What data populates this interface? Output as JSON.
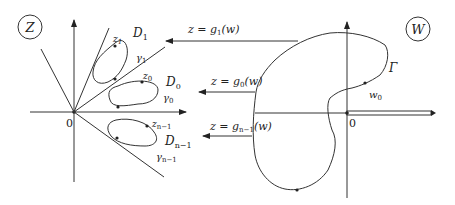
{
  "z_plane": {
    "badge": "Z",
    "origin": "0",
    "domains": [
      {
        "region": "D",
        "region_sub": "1",
        "curve": "γ",
        "curve_sub": "1",
        "point": "z",
        "point_sub": "1"
      },
      {
        "region": "D",
        "region_sub": "0",
        "curve": "γ",
        "curve_sub": "0",
        "point": "z",
        "point_sub": "0"
      },
      {
        "region": "D",
        "region_sub": "n−1",
        "curve": "γ",
        "curve_sub": "n−1",
        "point": "z",
        "point_sub": "n−1"
      }
    ]
  },
  "maps": [
    {
      "prefix": "z = g",
      "sub": "1",
      "suffix": "(w)"
    },
    {
      "prefix": "z = g",
      "sub": "0",
      "suffix": "(w)"
    },
    {
      "prefix": "z = g",
      "sub": "n−1",
      "suffix": "(w)"
    }
  ],
  "w_plane": {
    "badge": "W",
    "origin": "0",
    "contour": "Γ",
    "point": "w",
    "point_sub": "0"
  }
}
